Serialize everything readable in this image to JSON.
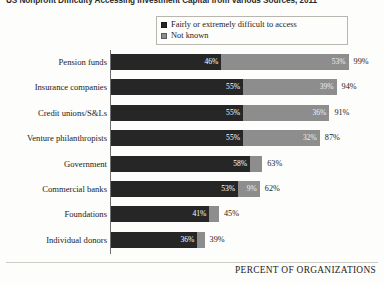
{
  "chart_data": {
    "type": "bar",
    "subtype": "horizontal-stacked-bar",
    "title": "US Nonprofit Difficulty Accessing Investment Capital from Various Sources, 2011",
    "xlabel": "PERCENT OF ORGANIZATIONS",
    "ylabel": "",
    "xlim": [
      0,
      100
    ],
    "grid": false,
    "legend_position": "top-right",
    "categories": [
      "Pension funds",
      "Insurance companies",
      "Credit unions/S&Ls",
      "Venture philanthropists",
      "Government",
      "Commercial banks",
      "Foundations",
      "Individual donors"
    ],
    "series": [
      {
        "name": "Fairly or extremely difficult to access",
        "color": "#262626",
        "values": [
          46,
          55,
          55,
          55,
          58,
          53,
          41,
          36
        ],
        "labels": [
          "46%",
          "55%",
          "55%",
          "55%",
          "58%",
          "53%",
          "41%",
          "36%"
        ]
      },
      {
        "name": "Not known",
        "color": "#8d8d8d",
        "values": [
          53,
          39,
          36,
          32,
          5,
          9,
          4,
          3
        ],
        "labels": [
          "53%",
          "39%",
          "36%",
          "32%",
          "5%",
          "9%",
          "4%",
          "3%"
        ]
      }
    ],
    "totals": [
      99,
      94,
      91,
      87,
      63,
      62,
      45,
      39
    ],
    "total_labels": [
      "99%",
      "94%",
      "91%",
      "87%",
      "63%",
      "62%",
      "45%",
      "39%"
    ]
  },
  "legend": {
    "items": [
      {
        "label": "Fairly or extremely difficult to access",
        "color": "#262626"
      },
      {
        "label": "Not known",
        "color": "#8d8d8d"
      }
    ]
  }
}
